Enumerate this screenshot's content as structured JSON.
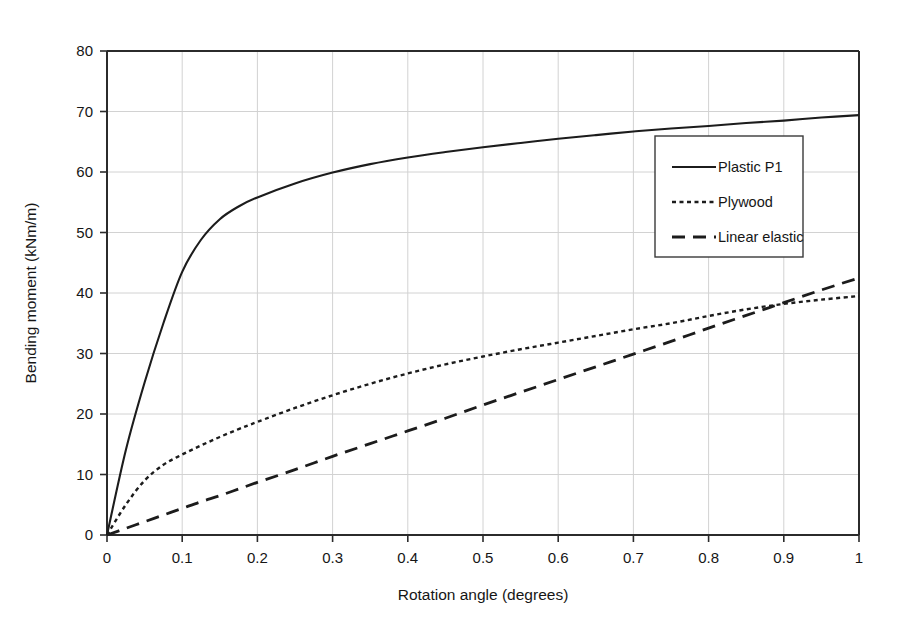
{
  "chart_data": {
    "type": "line",
    "title": "",
    "xlabel": "Rotation angle (degrees)",
    "ylabel": "Bending moment (kNm/m)",
    "xlim": [
      0,
      1
    ],
    "ylim": [
      0,
      80
    ],
    "xticks": [
      "0",
      "0.1",
      "0.2",
      "0.3",
      "0.4",
      "0.5",
      "0.6",
      "0.7",
      "0.8",
      "0.9",
      "1"
    ],
    "xtick_values": [
      0,
      0.1,
      0.2,
      0.3,
      0.4,
      0.5,
      0.6,
      0.7,
      0.8,
      0.9,
      1
    ],
    "yticks": [
      "0",
      "10",
      "20",
      "30",
      "40",
      "50",
      "60",
      "70",
      "80"
    ],
    "ytick_values": [
      0,
      10,
      20,
      30,
      40,
      50,
      60,
      70,
      80
    ],
    "grid": true,
    "grid_color": "#d2d2d2",
    "legend_position": "center-right",
    "x": [
      0,
      0.025,
      0.05,
      0.075,
      0.1,
      0.125,
      0.15,
      0.175,
      0.2,
      0.25,
      0.3,
      0.35,
      0.4,
      0.45,
      0.5,
      0.55,
      0.6,
      0.65,
      0.7,
      0.75,
      0.8,
      0.85,
      0.9,
      0.95,
      1
    ],
    "series": [
      {
        "name": "Plastic P1",
        "style": "solid",
        "color": "#1c1c1c",
        "values": [
          0,
          14.0,
          25.2,
          35.0,
          43.5,
          48.8,
          52.2,
          54.3,
          55.8,
          58.1,
          59.9,
          61.3,
          62.4,
          63.3,
          64.1,
          64.8,
          65.5,
          66.1,
          66.7,
          67.2,
          67.6,
          68.1,
          68.5,
          69.0,
          69.4
        ]
      },
      {
        "name": "Plywood",
        "style": "dotted",
        "color": "#1c1c1c",
        "values": [
          0,
          5.0,
          9.0,
          11.6,
          13.3,
          14.8,
          16.2,
          17.5,
          18.7,
          21.0,
          23.1,
          25.0,
          26.7,
          28.2,
          29.5,
          30.7,
          31.8,
          32.9,
          34.0,
          35.0,
          36.2,
          37.3,
          38.2,
          38.9,
          39.5
        ]
      },
      {
        "name": "Linear elastic",
        "style": "dashed",
        "color": "#1c1c1c",
        "values": [
          0,
          1.1,
          2.2,
          3.3,
          4.4,
          5.5,
          6.5,
          7.6,
          8.7,
          10.8,
          13.0,
          15.1,
          17.2,
          19.3,
          21.5,
          23.6,
          25.7,
          27.8,
          29.9,
          32.0,
          34.2,
          36.3,
          38.4,
          40.5,
          42.5
        ]
      }
    ]
  },
  "legend": {
    "items": [
      {
        "label": "Plastic P1",
        "style": "solid"
      },
      {
        "label": "Plywood",
        "style": "dotted"
      },
      {
        "label": "Linear elastic",
        "style": "dashed"
      }
    ]
  }
}
